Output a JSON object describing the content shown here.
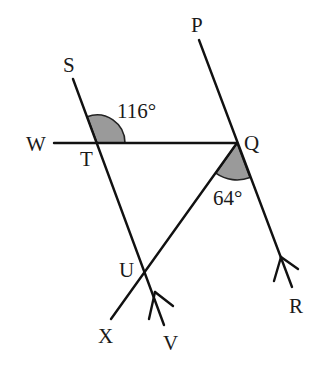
{
  "diagram": {
    "type": "geometry",
    "points": {
      "S": {
        "label": "S",
        "x": 73,
        "y": 79
      },
      "T": {
        "label": "T",
        "x": 97,
        "y": 143
      },
      "W": {
        "label": "W",
        "x": 54,
        "y": 143
      },
      "P": {
        "label": "P",
        "x": 199,
        "y": 40
      },
      "Q": {
        "label": "Q",
        "x": 237,
        "y": 143
      },
      "R": {
        "label": "R",
        "x": 292,
        "y": 287
      },
      "U": {
        "label": "U",
        "x": 146,
        "y": 270
      },
      "V": {
        "label": "V",
        "x": 164,
        "y": 325
      },
      "X": {
        "label": "X",
        "x": 111,
        "y": 319
      }
    },
    "angles": [
      {
        "vertex": "T",
        "between": [
          "S",
          "Q"
        ],
        "value": "116°"
      },
      {
        "vertex": "Q",
        "between": [
          "X",
          "R"
        ],
        "value": "64°"
      }
    ],
    "parallel_lines": [
      "SV",
      "PR"
    ],
    "segments": [
      "SV",
      "WQ",
      "PR",
      "QX"
    ]
  }
}
